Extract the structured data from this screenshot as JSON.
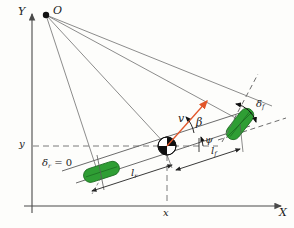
{
  "figure": {
    "kind": "vehicle-bicycle-model-diagram",
    "background_color": "#fdfdfb"
  },
  "axes": {
    "x_axis_label": "X",
    "y_axis_label": "Y",
    "x_tick_label": "x",
    "y_tick_label": "y",
    "axis_color": "#4a4a4a"
  },
  "points": {
    "origin_label": "O",
    "origin_color": "#111111",
    "cg_color_dark": "#111111",
    "cg_color_light": "#ffffff"
  },
  "vectors": {
    "velocity_label": "v",
    "velocity_color": "#e2562a"
  },
  "angles": {
    "sideslip_label": "β",
    "yaw_label": "ψ",
    "front_steer_symbol": "δ",
    "front_steer_subscript": "f",
    "rear_steer_text": "δ",
    "rear_steer_subscript": "r",
    "rear_steer_value": " = 0"
  },
  "dimensions": {
    "front_length_symbol": "l",
    "front_length_subscript": "f",
    "rear_length_symbol": "l",
    "rear_length_subscript": "r"
  },
  "wheels": {
    "front_wheel_color": "#2f9e34",
    "front_wheel_edge": "#1b6b20",
    "rear_wheel_color": "#2f9e34",
    "rear_wheel_edge": "#1b6b20"
  },
  "lines": {
    "ray_color": "#6f6f6f",
    "body_color": "#5a5a5a",
    "dash_color": "#7a7a7a"
  }
}
